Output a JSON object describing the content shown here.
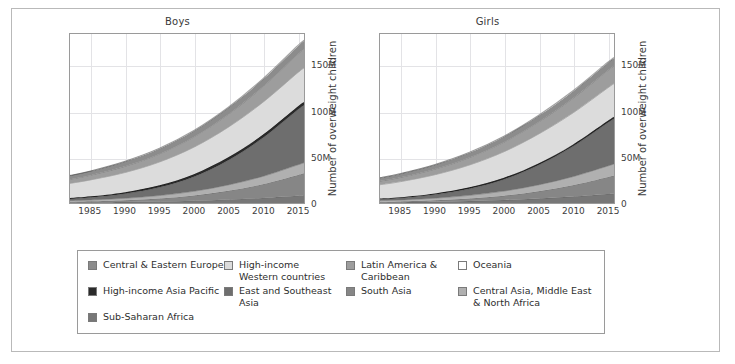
{
  "figure": {
    "ylabel": "Number of overweight children"
  },
  "panels": [
    {
      "key": "boys",
      "title": "Boys"
    },
    {
      "key": "girls",
      "title": "Girls"
    }
  ],
  "axis": {
    "xticks": [
      "1985",
      "1990",
      "1995",
      "2000",
      "2005",
      "2010",
      "2015"
    ],
    "yticks": [
      "0",
      "50M",
      "100M",
      "150M"
    ]
  },
  "legend": {
    "items": [
      {
        "label": "Central & Eastern Europe",
        "color": "#8c8c8c"
      },
      {
        "label": "High-income\nWestern countries",
        "color": "#dcdcdc"
      },
      {
        "label": "Latin America &\nCaribbean",
        "color": "#9d9d9d"
      },
      {
        "label": "Oceania",
        "color": "#ffffff"
      },
      {
        "label": "High-income Asia Pacific",
        "color": "#2b2b2b"
      },
      {
        "label": "East and Southeast\nAsia",
        "color": "#6e6e6e"
      },
      {
        "label": "South Asia",
        "color": "#868686"
      },
      {
        "label": "Central Asia, Middle East\n& North Africa",
        "color": "#b0b0b0"
      },
      {
        "label": "Sub-Saharan Africa",
        "color": "#777777"
      }
    ]
  },
  "chart_data": {
    "type": "area",
    "xlabel": "",
    "ylabel": "Number of overweight children",
    "xlim": [
      1982,
      2016
    ],
    "ylim": [
      0,
      185
    ],
    "y_unit": "millions",
    "grid": true,
    "legend_position": "bottom",
    "stacked": true,
    "x": [
      1982,
      1985,
      1990,
      1995,
      2000,
      2005,
      2010,
      2015,
      2016
    ],
    "panels": [
      {
        "name": "Boys",
        "series": [
          {
            "name": "Sub-Saharan Africa",
            "color": "#777777",
            "values": [
              0.5,
              0.7,
              1.1,
              1.7,
              2.6,
              3.9,
              5.6,
              8.0,
              8.6
            ]
          },
          {
            "name": "South Asia",
            "color": "#868686",
            "values": [
              0.8,
              1.1,
              1.9,
              3.3,
              5.6,
              9.5,
              15.0,
              22.5,
              24.0
            ]
          },
          {
            "name": "Central Asia, Middle East & North Africa",
            "color": "#b0b0b0",
            "values": [
              1.2,
              1.5,
              2.2,
              3.2,
              4.6,
              6.4,
              8.5,
              11.0,
              11.5
            ]
          },
          {
            "name": "East and Southeast Asia",
            "color": "#6e6e6e",
            "values": [
              2.0,
              2.8,
              5.0,
              9.0,
              16.0,
              27.0,
              42.0,
              60.0,
              63.0
            ]
          },
          {
            "name": "High-income Asia Pacific",
            "color": "#2b2b2b",
            "values": [
              1.0,
              1.2,
              1.7,
              2.2,
              2.8,
              3.2,
              3.5,
              3.6,
              3.6
            ]
          },
          {
            "name": "High-income Western countries",
            "color": "#dcdcdc",
            "values": [
              16.0,
              18.0,
              21.5,
              25.5,
              29.5,
              33.0,
              35.5,
              37.0,
              37.2
            ]
          },
          {
            "name": "Latin America & Caribbean",
            "color": "#9d9d9d",
            "values": [
              4.5,
              5.2,
              6.8,
              8.8,
              11.2,
              14.0,
              17.0,
              20.0,
              20.5
            ]
          },
          {
            "name": "Central & Eastern Europe",
            "color": "#8c8c8c",
            "values": [
              4.0,
              4.4,
              5.2,
              5.8,
              6.5,
              7.2,
              8.0,
              8.8,
              9.0
            ]
          },
          {
            "name": "Oceania",
            "color": "#ffffff",
            "values": [
              0.2,
              0.2,
              0.3,
              0.4,
              0.5,
              0.6,
              0.7,
              0.8,
              0.8
            ]
          }
        ],
        "total_values": [
          30.2,
          35.1,
          45.7,
          59.9,
          79.3,
          104.8,
          135.8,
          171.7,
          178.2
        ]
      },
      {
        "name": "Girls",
        "series": [
          {
            "name": "Sub-Saharan Africa",
            "color": "#777777",
            "values": [
              0.6,
              0.8,
              1.3,
              2.1,
              3.2,
              4.8,
              7.0,
              9.8,
              10.4
            ]
          },
          {
            "name": "South Asia",
            "color": "#868686",
            "values": [
              0.7,
              0.9,
              1.6,
              2.8,
              4.8,
              8.0,
              12.5,
              18.5,
              19.8
            ]
          },
          {
            "name": "Central Asia, Middle East & North Africa",
            "color": "#b0b0b0",
            "values": [
              1.3,
              1.6,
              2.4,
              3.5,
              5.0,
              7.0,
              9.3,
              12.0,
              12.6
            ]
          },
          {
            "name": "East and Southeast Asia",
            "color": "#6e6e6e",
            "values": [
              1.6,
              2.2,
              4.0,
              7.2,
              12.8,
              21.5,
              33.0,
              47.0,
              49.5
            ]
          },
          {
            "name": "High-income Asia Pacific",
            "color": "#2b2b2b",
            "values": [
              0.8,
              0.9,
              1.2,
              1.5,
              1.8,
              2.0,
              2.1,
              2.2,
              2.2
            ]
          },
          {
            "name": "High-income Western countries",
            "color": "#dcdcdc",
            "values": [
              15.0,
              17.0,
              20.5,
              24.5,
              28.5,
              32.0,
              34.5,
              36.0,
              36.2
            ]
          },
          {
            "name": "Latin America & Caribbean",
            "color": "#9d9d9d",
            "values": [
              4.0,
              4.7,
              6.2,
              8.2,
              10.5,
              13.2,
              16.0,
              19.0,
              19.5
            ]
          },
          {
            "name": "Central & Eastern Europe",
            "color": "#8c8c8c",
            "values": [
              3.6,
              4.0,
              4.7,
              5.3,
              6.0,
              6.7,
              7.5,
              8.2,
              8.4
            ]
          },
          {
            "name": "Oceania",
            "color": "#ffffff",
            "values": [
              0.2,
              0.2,
              0.3,
              0.4,
              0.5,
              0.6,
              0.7,
              0.8,
              0.8
            ]
          }
        ],
        "total_values": [
          27.8,
          32.3,
          42.2,
          55.5,
          73.1,
          95.8,
          122.6,
          153.5,
          159.4
        ]
      }
    ]
  }
}
